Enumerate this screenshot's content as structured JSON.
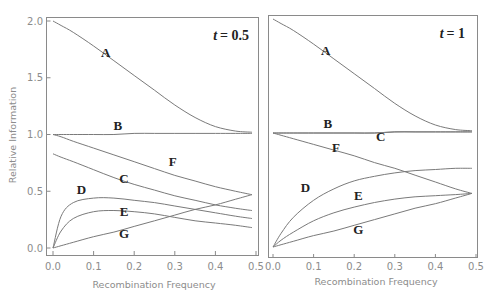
{
  "chart_data": [
    {
      "type": "line",
      "title": "t = 0.5",
      "title_var": "t",
      "title_value": "= 0.5",
      "xlabel": "Recombination Frequency",
      "ylabel": "Relative Information",
      "xlim": [
        0,
        0.5
      ],
      "ylim": [
        0,
        2.0
      ],
      "xticks": [
        "0.0",
        "0.1",
        "0.2",
        "0.3",
        "0.4",
        "0.5"
      ],
      "yticks": [
        "0.0",
        "0.5",
        "1.0",
        "1.5",
        "2.0"
      ],
      "grid": false,
      "x": [
        0.0,
        0.02,
        0.05,
        0.1,
        0.15,
        0.2,
        0.25,
        0.3,
        0.35,
        0.4,
        0.45,
        0.49
      ],
      "series": [
        {
          "name": "A",
          "values": [
            2.0,
            1.96,
            1.9,
            1.78,
            1.65,
            1.52,
            1.39,
            1.26,
            1.15,
            1.07,
            1.03,
            1.02
          ],
          "label_pos": [
            0.13,
            1.68
          ]
        },
        {
          "name": "B",
          "values": [
            1.0,
            1.0,
            1.0,
            1.0,
            1.0,
            1.01,
            1.01,
            1.01,
            1.01,
            1.01,
            1.01,
            1.01
          ],
          "label_pos": [
            0.16,
            1.04
          ]
        },
        {
          "name": "C",
          "values": [
            0.83,
            0.8,
            0.76,
            0.69,
            0.62,
            0.56,
            0.51,
            0.46,
            0.42,
            0.38,
            0.35,
            0.33
          ],
          "label_pos": [
            0.175,
            0.57
          ]
        },
        {
          "name": "D",
          "values": [
            0.0,
            0.28,
            0.4,
            0.44,
            0.44,
            0.42,
            0.4,
            0.37,
            0.34,
            0.31,
            0.28,
            0.26
          ],
          "label_pos": [
            0.07,
            0.48
          ]
        },
        {
          "name": "E",
          "values": [
            0.0,
            0.15,
            0.26,
            0.32,
            0.33,
            0.32,
            0.3,
            0.27,
            0.24,
            0.22,
            0.2,
            0.18
          ],
          "label_pos": [
            0.175,
            0.28
          ]
        },
        {
          "name": "F",
          "values": [
            1.0,
            0.98,
            0.94,
            0.88,
            0.82,
            0.76,
            0.7,
            0.64,
            0.59,
            0.54,
            0.5,
            0.47
          ],
          "label_pos": [
            0.295,
            0.72
          ]
        },
        {
          "name": "G",
          "values": [
            0.0,
            0.02,
            0.05,
            0.1,
            0.14,
            0.19,
            0.24,
            0.29,
            0.34,
            0.38,
            0.43,
            0.47
          ],
          "label_pos": [
            0.175,
            0.09
          ]
        }
      ]
    },
    {
      "type": "line",
      "title": "t = 1",
      "title_var": "t",
      "title_value": "= 1",
      "xlabel": "Recombination Frequency",
      "ylabel": "Relative Information",
      "xlim": [
        0,
        0.5
      ],
      "ylim": [
        0,
        2.0
      ],
      "xticks": [
        "0.0",
        "0.1",
        "0.2",
        "0.3",
        "0.4",
        "0.5"
      ],
      "yticks": [
        "0.0",
        "0.5",
        "1.0",
        "1.5",
        "2.0"
      ],
      "grid": false,
      "x": [
        0.0,
        0.02,
        0.05,
        0.1,
        0.15,
        0.2,
        0.25,
        0.3,
        0.35,
        0.4,
        0.45,
        0.49
      ],
      "series": [
        {
          "name": "A",
          "values": [
            2.0,
            1.96,
            1.9,
            1.78,
            1.65,
            1.52,
            1.39,
            1.26,
            1.15,
            1.07,
            1.03,
            1.02
          ],
          "label_pos": [
            0.13,
            1.68
          ]
        },
        {
          "name": "B",
          "values": [
            1.0,
            1.0,
            1.0,
            1.0,
            1.0,
            1.0,
            1.0,
            1.01,
            1.01,
            1.01,
            1.01,
            1.01
          ],
          "label_pos": [
            0.135,
            1.04
          ]
        },
        {
          "name": "C",
          "values": [
            1.0,
            1.0,
            1.0,
            1.0,
            1.0,
            1.0,
            1.0,
            1.01,
            1.01,
            1.01,
            1.01,
            1.01
          ],
          "label_pos": [
            0.265,
            0.93
          ]
        },
        {
          "name": "D",
          "values": [
            0.0,
            0.12,
            0.26,
            0.41,
            0.51,
            0.58,
            0.62,
            0.65,
            0.67,
            0.68,
            0.69,
            0.69
          ],
          "label_pos": [
            0.08,
            0.48
          ]
        },
        {
          "name": "E",
          "values": [
            0.0,
            0.06,
            0.13,
            0.23,
            0.3,
            0.35,
            0.39,
            0.42,
            0.44,
            0.45,
            0.46,
            0.47
          ],
          "label_pos": [
            0.21,
            0.41
          ]
        },
        {
          "name": "F",
          "values": [
            1.0,
            0.98,
            0.95,
            0.9,
            0.85,
            0.8,
            0.74,
            0.69,
            0.63,
            0.57,
            0.51,
            0.47
          ],
          "label_pos": [
            0.155,
            0.83
          ]
        },
        {
          "name": "G",
          "values": [
            0.0,
            0.02,
            0.05,
            0.1,
            0.14,
            0.19,
            0.24,
            0.29,
            0.34,
            0.38,
            0.43,
            0.47
          ],
          "label_pos": [
            0.21,
            0.11
          ]
        }
      ]
    }
  ]
}
